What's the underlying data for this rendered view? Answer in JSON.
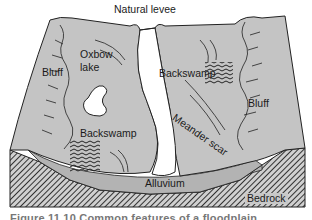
{
  "diagram": {
    "type": "block-diagram",
    "labels": {
      "natural_levee": "Natural levee",
      "oxbow_lake_1": "Oxbow",
      "oxbow_lake_2": "lake",
      "bluff_left": "Bluff",
      "bluff_right": "Bluff",
      "backswamp_top": "Backswamp",
      "backswamp_bottom": "Backswamp",
      "meander_scar": "Meander scar",
      "alluvium": "Alluvium",
      "bedrock": "Bedrock"
    },
    "caption": "Figure 11.10  Common features of a floodplain",
    "colors": {
      "surface": "#c4c4c4",
      "alluvium": "#b3b3b3",
      "bedrock_hatch": "#3a3a3a",
      "river": "#ffffff",
      "line": "#222222"
    }
  }
}
